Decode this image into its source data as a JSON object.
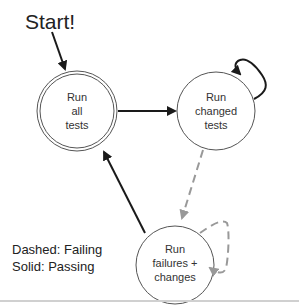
{
  "diagram": {
    "start_label": "Start!",
    "nodes": [
      {
        "id": "run-all",
        "lines": [
          "Run",
          "all",
          "tests"
        ],
        "double_border": true
      },
      {
        "id": "run-changed",
        "lines": [
          "Run",
          "changed",
          "tests"
        ],
        "double_border": false
      },
      {
        "id": "run-failures",
        "lines": [
          "Run",
          "failures +",
          "changes"
        ],
        "double_border": false
      }
    ],
    "edges": [
      {
        "from": "start",
        "to": "run-all",
        "style": "solid"
      },
      {
        "from": "run-all",
        "to": "run-changed",
        "style": "solid"
      },
      {
        "from": "run-changed",
        "to": "run-changed",
        "style": "solid"
      },
      {
        "from": "run-changed",
        "to": "run-failures",
        "style": "dashed"
      },
      {
        "from": "run-failures",
        "to": "run-failures",
        "style": "dashed"
      },
      {
        "from": "run-failures",
        "to": "run-all",
        "style": "solid"
      }
    ],
    "legend": {
      "dashed": "Dashed: Failing",
      "solid": "Solid: Passing"
    },
    "colors": {
      "solid_edge": "#1a1a1a",
      "dashed_edge": "#999999",
      "node_border": "#555555",
      "bottom_rule": "#d0d0d0"
    }
  }
}
